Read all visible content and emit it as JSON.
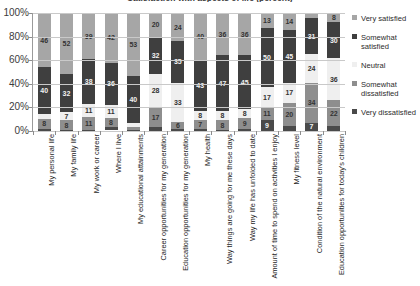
{
  "chart_data": {
    "type": "bar",
    "subtype": "stacked-percentage-column",
    "title": "Satisfaction with aspects of life (percent)",
    "xlabel": "",
    "ylabel": "",
    "ylim": [
      0,
      100
    ],
    "ytick_labels": [
      "0%",
      "20%",
      "40%",
      "60%",
      "80%",
      "100%"
    ],
    "ytick_values": [
      0,
      20,
      40,
      60,
      80,
      100
    ],
    "grid": true,
    "legend_position": "right",
    "categories": [
      "My personal life",
      "My family life",
      "My work or career",
      "Where I live",
      "My educational attainments",
      "Career opportunities for my generation",
      "Education opportunities for my generation",
      "My health",
      "Way things are going for me these days",
      "Way my life has unfolded to date",
      "Amount of time to spend on activities I enjoy",
      "My fitness level",
      "Condition of the natural environment",
      "Education opportunities for today's children"
    ],
    "series": [
      {
        "name": "Very satisfied",
        "color": "#a6a6a6",
        "values": [
          46,
          52,
          39,
          42,
          53,
          20,
          24,
          40,
          36,
          36,
          13,
          14,
          4,
          8
        ]
      },
      {
        "name": "Somewhat satisfied",
        "color": "#3f3f3f",
        "values": [
          40,
          32,
          38,
          36,
          40,
          32,
          35,
          43,
          47,
          45,
          50,
          45,
          31,
          30
        ]
      },
      {
        "name": "Neutral",
        "color": "#efefef",
        "values": [
          4,
          7,
          11,
          11,
          4,
          28,
          33,
          8,
          8,
          8,
          17,
          17,
          24,
          36
        ]
      },
      {
        "name": "Somewhat dissatisfied",
        "color": "#8e8e8e",
        "values": [
          8,
          8,
          11,
          8,
          2,
          17,
          6,
          7,
          8,
          9,
          11,
          20,
          34,
          22
        ]
      },
      {
        "name": "Very dissatisfied",
        "color": "#4a4a4a",
        "values": [
          2,
          1,
          1,
          2,
          1,
          3,
          2,
          2,
          1,
          2,
          9,
          4,
          7,
          4
        ]
      }
    ]
  },
  "legend": {
    "items": [
      {
        "label": "Very satisfied"
      },
      {
        "label": "Somewhat satisfied"
      },
      {
        "label": "Neutral"
      },
      {
        "label": "Somewhat dissatisfied"
      },
      {
        "label": "Very dissatisfied"
      }
    ]
  }
}
